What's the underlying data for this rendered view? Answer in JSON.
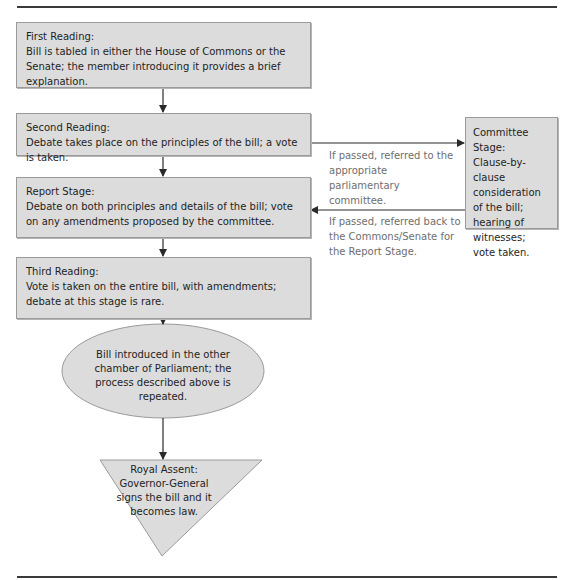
{
  "diagram": {
    "stages": [
      {
        "id": "first-reading",
        "title": "First Reading:",
        "text": "Bill is tabled in either the House of Commons or the Senate; the member introducing it provides a brief explanation."
      },
      {
        "id": "second-reading",
        "title": "Second Reading:",
        "text": "Debate takes place on the principles of the bill; a vote is taken."
      },
      {
        "id": "report-stage",
        "title": "Report Stage:",
        "text": "Debate on both principles and details of the bill; vote on any amendments proposed by the committee."
      },
      {
        "id": "third-reading",
        "title": "Third Reading:",
        "text": "Vote is taken on the entire bill, with amendments; debate at this stage is rare."
      }
    ],
    "committee": {
      "title": "Committee Stage:",
      "text": "Clause-by-clause consideration of the bill; hearing of witnesses; vote taken."
    },
    "other_chamber": {
      "text": "Bill introduced in the other chamber of Parliament; the process described above is repeated."
    },
    "royal_assent": {
      "title": "Royal Assent:",
      "text": "Governor-General signs the bill and it becomes law."
    },
    "notes": {
      "to_committee": "If passed, referred to the appropriate parliamentary committee.",
      "back_from_committee": "If passed, referred back to the Commons/Senate for the Report Stage."
    },
    "colors": {
      "box_fill": "#dcdcdc",
      "box_border": "#9a9a9a",
      "arrow": "#2a2a2a",
      "note_text": "#6e6e6e",
      "rule": "#3a3a3a"
    }
  }
}
